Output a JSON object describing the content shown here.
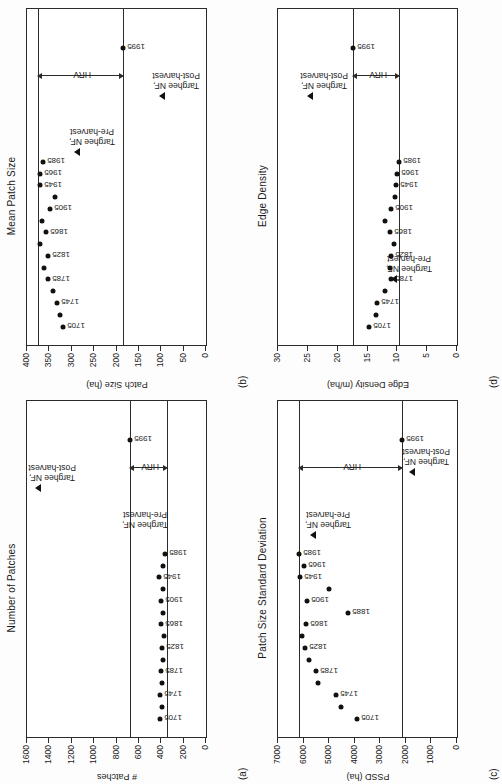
{
  "figure": {
    "orientation": "rotated-90-ccw",
    "background": "#fdfdfd",
    "marker_color": "#111111",
    "axis_color": "#2b2b2b",
    "hrv_label": "HRV",
    "pre_harvest_label_line1": "Targhee NF,",
    "pre_harvest_label_line2": "Pre-harvest",
    "post_harvest_label_line1": "Targhee NF,",
    "post_harvest_label_line2": "Post-harvest"
  },
  "chart_data": [
    {
      "panel": "a",
      "panel_letter": "(a)",
      "type": "scatter",
      "title": "Number of Patches",
      "ylabel": "# Patches",
      "ylim": [
        0,
        1600
      ],
      "yticks": [
        1600,
        1400,
        1200,
        1000,
        800,
        600,
        400,
        200,
        0
      ],
      "ytick_labels": [
        "1600",
        "1400",
        "1200",
        "1000",
        "800",
        "600",
        "400",
        "200",
        "0"
      ],
      "grid": false,
      "hrv_upper": 680,
      "hrv_lower": 350,
      "x": [
        1705,
        1725,
        1745,
        1765,
        1785,
        1805,
        1825,
        1845,
        1865,
        1885,
        1905,
        1925,
        1945,
        1965,
        1985
      ],
      "values": [
        410,
        395,
        410,
        390,
        400,
        380,
        395,
        375,
        400,
        380,
        400,
        385,
        420,
        385,
        370
      ],
      "labeled_points": [
        "1705",
        "1745",
        "1785",
        "1825",
        "1865",
        "1905",
        "1945",
        "1985"
      ],
      "special_points": [
        {
          "label": "1995",
          "x_frac": 0.885,
          "value": 680,
          "marker": "circle"
        },
        {
          "label_ref": "pre_harvest",
          "x_frac": 0.6,
          "value": 680,
          "marker": "none"
        },
        {
          "label_ref": "post_harvest",
          "x_frac": 0.74,
          "value": 1500,
          "marker": "triangle"
        }
      ]
    },
    {
      "panel": "b",
      "panel_letter": "(b)",
      "type": "scatter",
      "title": "Mean Patch Size",
      "ylabel": "Patch Size (ha)",
      "ylim": [
        0,
        400
      ],
      "yticks": [
        400,
        350,
        300,
        250,
        200,
        150,
        100,
        50,
        0
      ],
      "ytick_labels": [
        "400",
        "350",
        "300",
        "250",
        "200",
        "150",
        "100",
        "50",
        "0"
      ],
      "grid": false,
      "hrv_upper": 375,
      "hrv_lower": 186,
      "x": [
        1705,
        1725,
        1745,
        1765,
        1785,
        1805,
        1825,
        1845,
        1865,
        1885,
        1905,
        1925,
        1945,
        1965,
        1985
      ],
      "values": [
        320,
        327,
        332,
        342,
        354,
        362,
        352,
        371,
        357,
        366,
        348,
        338,
        371,
        370,
        364
      ],
      "labeled_points": [
        "1705",
        "1745",
        "1785",
        "1825",
        "1865",
        "1905",
        "1945",
        "1965",
        "1985"
      ],
      "special_points": [
        {
          "label": "1995",
          "x_frac": 0.885,
          "value": 186,
          "marker": "circle"
        },
        {
          "label_ref": "pre_harvest",
          "x_frac": 0.575,
          "value": 288,
          "marker": "triangle"
        },
        {
          "label_ref": "post_harvest",
          "x_frac": 0.74,
          "value": 98,
          "marker": "triangle"
        }
      ]
    },
    {
      "panel": "c",
      "panel_letter": "(c)",
      "type": "scatter",
      "title": "Patch Size Standard Deviation",
      "ylabel": "PSSD (ha)",
      "ylim": [
        0,
        7000
      ],
      "yticks": [
        7000,
        6000,
        5000,
        4000,
        3000,
        2000,
        1000,
        0
      ],
      "ytick_labels": [
        "7000",
        "6000",
        "5000",
        "4000",
        "3000",
        "2000",
        "1000",
        "0"
      ],
      "grid": false,
      "hrv_upper": 6180,
      "hrv_lower": 2160,
      "x": [
        1705,
        1725,
        1745,
        1765,
        1785,
        1805,
        1825,
        1845,
        1865,
        1885,
        1905,
        1925,
        1945,
        1965,
        1985
      ],
      "values": [
        3920,
        4520,
        4720,
        5430,
        5530,
        5790,
        5960,
        6080,
        5900,
        4250,
        5880,
        5010,
        6130,
        6000,
        6180
      ],
      "labeled_points": [
        "1705",
        "1745",
        "1785",
        "1825",
        "1865",
        "1885",
        "1905",
        "1945",
        "1965",
        "1985"
      ],
      "special_points": [
        {
          "label": "1995",
          "x_frac": 0.885,
          "value": 2160,
          "marker": "circle"
        },
        {
          "label_ref": "pre_harvest",
          "x_frac": 0.6,
          "value": 5620,
          "marker": "triangle"
        },
        {
          "label_ref": "post_harvest",
          "x_frac": 0.79,
          "value": 1760,
          "marker": "triangle"
        }
      ]
    },
    {
      "panel": "d",
      "panel_letter": "(d)",
      "type": "scatter",
      "title": "Edge Density",
      "ylabel": "Edge Density (m/ha)",
      "ylim": [
        0,
        30
      ],
      "yticks": [
        30,
        25,
        20,
        15,
        10,
        5,
        0
      ],
      "ytick_labels": [
        "30",
        "25",
        "20",
        "15",
        "10",
        "5",
        "0"
      ],
      "grid": false,
      "hrv_upper": 17.4,
      "hrv_lower": 9.8,
      "x": [
        1705,
        1725,
        1745,
        1765,
        1785,
        1805,
        1825,
        1845,
        1865,
        1885,
        1905,
        1925,
        1945,
        1965,
        1985
      ],
      "values": [
        14.8,
        13.6,
        13.4,
        12.1,
        11.0,
        11.3,
        11.0,
        10.5,
        11.2,
        12.0,
        11.0,
        10.4,
        10.2,
        10.0,
        9.8
      ],
      "labeled_points": [
        "1705",
        "1745",
        "1785",
        "1825",
        "1865",
        "1905",
        "1945",
        "1965",
        "1985"
      ],
      "special_points": [
        {
          "label": "1995",
          "x_frac": 0.885,
          "value": 17.4,
          "marker": "circle"
        },
        {
          "label_ref": "pre_harvest",
          "x_frac": 0.195,
          "value": 10.6,
          "marker": "triangle"
        },
        {
          "label_ref": "post_harvest",
          "x_frac": 0.74,
          "value": 24.6,
          "marker": "triangle"
        }
      ]
    }
  ]
}
